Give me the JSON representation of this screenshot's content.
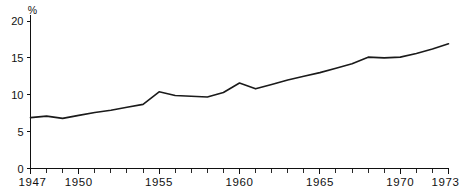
{
  "chart_data": {
    "type": "line",
    "title": "",
    "xlabel": "",
    "ylabel": "%",
    "unit_label": "%",
    "xlim": [
      1947,
      1973
    ],
    "ylim": [
      0,
      20
    ],
    "grid": false,
    "legend": "none",
    "y_ticks": [
      0,
      5,
      10,
      15,
      20
    ],
    "y_tick_labels": [
      "0",
      "5",
      "10",
      "15",
      "20"
    ],
    "x_tick_labels": [
      "1947",
      "1950",
      "1955",
      "1960",
      "1965",
      "1970",
      "1973"
    ],
    "x_tick_label_years": [
      1947,
      1950,
      1955,
      1960,
      1965,
      1970,
      1973
    ],
    "x_minor_tick_years": [
      1948,
      1949,
      1951,
      1952,
      1953,
      1954,
      1956,
      1957,
      1958,
      1959,
      1961,
      1962,
      1963,
      1964,
      1966,
      1967,
      1968,
      1969,
      1971,
      1972
    ],
    "x": [
      1947,
      1948,
      1949,
      1950,
      1951,
      1952,
      1953,
      1954,
      1955,
      1956,
      1957,
      1958,
      1959,
      1960,
      1961,
      1962,
      1963,
      1964,
      1965,
      1966,
      1967,
      1968,
      1969,
      1970,
      1971,
      1972,
      1973
    ],
    "values": [
      6.9,
      7.1,
      6.8,
      7.2,
      7.6,
      7.9,
      8.3,
      8.7,
      10.4,
      9.9,
      9.8,
      9.7,
      10.3,
      11.6,
      10.8,
      11.4,
      12.0,
      12.5,
      13.0,
      13.6,
      14.2,
      15.1,
      15.0,
      15.1,
      15.6,
      16.2,
      16.9
    ],
    "series_name": "",
    "line_color": "#1a1a1a",
    "axis_color": "#111111",
    "background_color": "#ffffff"
  }
}
